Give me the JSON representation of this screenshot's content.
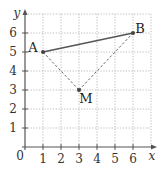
{
  "diagram": {
    "type": "coordinate-grid",
    "axes": {
      "x_label": "x",
      "y_label": "y",
      "origin_label": "0",
      "x_ticks": [
        "1",
        "2",
        "3",
        "4",
        "5",
        "6"
      ],
      "y_ticks": [
        "1",
        "2",
        "3",
        "4",
        "5",
        "6"
      ],
      "grid": "dotted"
    },
    "points": [
      {
        "name": "A",
        "x": 1,
        "y": 5
      },
      {
        "name": "B",
        "x": 6,
        "y": 6
      },
      {
        "name": "M",
        "x": 3,
        "y": 3
      }
    ],
    "segments": [
      {
        "from": "A",
        "to": "B",
        "style": "solid"
      },
      {
        "from": "A",
        "to": "M",
        "style": "dashed"
      },
      {
        "from": "M",
        "to": "B",
        "style": "dashed"
      }
    ],
    "colors": {
      "axis": "#555555",
      "grid": "#aaaaaa",
      "segment": "#555555",
      "point": "#444444"
    }
  }
}
